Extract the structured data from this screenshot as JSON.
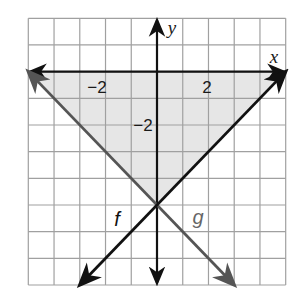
{
  "chart_data": {
    "type": "line",
    "title": "",
    "xlabel": "x",
    "ylabel": "y",
    "xlim": [
      -5,
      5
    ],
    "ylim": [
      -8,
      2
    ],
    "grid": true,
    "grid_step": 1,
    "x_tick_labels": [
      {
        "value": -2,
        "text": "−2"
      },
      {
        "value": 2,
        "text": "2"
      }
    ],
    "y_tick_labels": [
      {
        "value": -2,
        "text": "−2"
      }
    ],
    "series": [
      {
        "name": "f",
        "label": "f",
        "equation": "f(x) = x - 5",
        "color": "#111111",
        "points": [
          [
            -3,
            -8
          ],
          [
            5,
            0
          ]
        ],
        "arrows": "both"
      },
      {
        "name": "g",
        "label": "g",
        "equation": "g(x) = -x - 5",
        "color": "#555555",
        "points": [
          [
            -5,
            0
          ],
          [
            3,
            -8
          ]
        ],
        "arrows": "both"
      }
    ],
    "shaded_region": {
      "description": "triangle bounded by x-axis, f and g",
      "vertices": [
        [
          -5,
          0
        ],
        [
          5,
          0
        ],
        [
          0,
          -5
        ]
      ],
      "color": "#e6e6e6"
    },
    "intersection": [
      0,
      -5
    ],
    "legend": "inline labels near lines"
  },
  "labels": {
    "x_axis": "x",
    "y_axis": "y",
    "f": "f",
    "g": "g",
    "x_tick_neg2": "−2",
    "x_tick_pos2": "2",
    "y_tick_neg2": "−2"
  },
  "colors": {
    "background": "#ffffff",
    "grid": "#a0a0a0",
    "axis": "#111111",
    "f_line": "#111111",
    "g_line": "#555555",
    "shade": "#e6e6e6"
  }
}
